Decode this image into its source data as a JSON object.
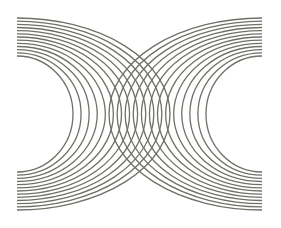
{
  "figure": {
    "width": 281,
    "height": 228,
    "background": "#ffffff",
    "line_color": "#707068",
    "line_width": 1.3,
    "center_y": 114,
    "arc_sets": [
      {
        "name": "left-arc-set",
        "center_x": 17,
        "direction": 1,
        "count": 13,
        "rx_inner": 56,
        "rx_outer": 153,
        "ry_inner": 58,
        "ry_outer": 96
      },
      {
        "name": "right-arc-set",
        "center_x": 262,
        "direction": -1,
        "count": 13,
        "rx_inner": 56,
        "rx_outer": 153,
        "ry_inner": 58,
        "ry_outer": 96
      }
    ]
  }
}
